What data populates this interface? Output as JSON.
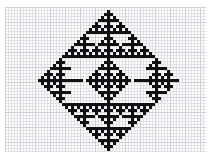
{
  "figure": {
    "kind": "pixel-grid-pattern"
  },
  "canvas": {
    "width": 211,
    "height": 165,
    "background_color": "#ffffff"
  },
  "graph_paper": {
    "left": 5,
    "top": 7,
    "width": 201,
    "height": 145,
    "cell_size": 3,
    "major_every": 5,
    "minor_line_color": "#e2e2e6",
    "major_line_color": "#cfcfd6",
    "paper_color": "#ffffff",
    "columns": 67,
    "rows": 48
  },
  "pattern": {
    "fill_color": "#111111",
    "cell_size": 3,
    "origin_col": 0,
    "origin_row": 0,
    "rule": "rule90-sierpinski-diamond",
    "center_col": 34,
    "top_row": 1,
    "bottom_row": 47,
    "half_height": 23,
    "description": "Rhombus outline with nested Sierpinski triangle texture, built row by row from a Rule 90 style cellular automaton and mirrored vertically about the mid row.",
    "rows": [
      {
        "row": 1,
        "runs": [
          [
            34,
            1
          ]
        ]
      },
      {
        "row": 2,
        "runs": [
          [
            33,
            3
          ]
        ]
      },
      {
        "row": 3,
        "runs": [
          [
            32,
            1
          ],
          [
            34,
            1
          ],
          [
            36,
            1
          ]
        ]
      },
      {
        "row": 4,
        "runs": [
          [
            31,
            7
          ]
        ]
      },
      {
        "row": 5,
        "runs": [
          [
            30,
            1
          ],
          [
            34,
            1
          ],
          [
            38,
            1
          ]
        ]
      },
      {
        "row": 6,
        "runs": [
          [
            29,
            3
          ],
          [
            33,
            3
          ],
          [
            37,
            3
          ]
        ]
      },
      {
        "row": 7,
        "runs": [
          [
            28,
            1
          ],
          [
            30,
            1
          ],
          [
            32,
            1
          ],
          [
            34,
            1
          ],
          [
            36,
            1
          ],
          [
            38,
            1
          ],
          [
            40,
            1
          ]
        ]
      },
      {
        "row": 8,
        "runs": [
          [
            27,
            15
          ]
        ]
      },
      {
        "row": 9,
        "runs": [
          [
            26,
            1
          ],
          [
            34,
            1
          ],
          [
            42,
            1
          ]
        ]
      },
      {
        "row": 10,
        "runs": [
          [
            25,
            3
          ],
          [
            33,
            3
          ],
          [
            41,
            3
          ]
        ]
      },
      {
        "row": 11,
        "runs": [
          [
            24,
            1
          ],
          [
            26,
            1
          ],
          [
            32,
            1
          ],
          [
            34,
            1
          ],
          [
            36,
            1
          ],
          [
            42,
            1
          ],
          [
            44,
            1
          ]
        ]
      },
      {
        "row": 12,
        "runs": [
          [
            23,
            7
          ],
          [
            31,
            7
          ],
          [
            39,
            7
          ]
        ]
      },
      {
        "row": 13,
        "runs": [
          [
            22,
            1
          ],
          [
            26,
            1
          ],
          [
            30,
            1
          ],
          [
            34,
            1
          ],
          [
            38,
            1
          ],
          [
            42,
            1
          ],
          [
            46,
            1
          ]
        ]
      },
      {
        "row": 14,
        "runs": [
          [
            21,
            3
          ],
          [
            25,
            3
          ],
          [
            29,
            3
          ],
          [
            33,
            3
          ],
          [
            37,
            3
          ],
          [
            41,
            3
          ],
          [
            45,
            3
          ]
        ]
      },
      {
        "row": 15,
        "runs": [
          [
            20,
            1
          ],
          [
            22,
            1
          ],
          [
            24,
            1
          ],
          [
            26,
            1
          ],
          [
            28,
            1
          ],
          [
            30,
            1
          ],
          [
            32,
            1
          ],
          [
            34,
            1
          ],
          [
            36,
            1
          ],
          [
            38,
            1
          ],
          [
            40,
            1
          ],
          [
            42,
            1
          ],
          [
            44,
            1
          ],
          [
            46,
            1
          ],
          [
            48,
            1
          ]
        ]
      },
      {
        "row": 16,
        "runs": [
          [
            19,
            31
          ]
        ]
      },
      {
        "row": 17,
        "runs": [
          [
            18,
            1
          ],
          [
            34,
            1
          ],
          [
            50,
            1
          ]
        ]
      },
      {
        "row": 18,
        "runs": [
          [
            17,
            3
          ],
          [
            33,
            3
          ],
          [
            49,
            3
          ]
        ]
      },
      {
        "row": 19,
        "runs": [
          [
            16,
            1
          ],
          [
            18,
            1
          ],
          [
            32,
            1
          ],
          [
            34,
            1
          ],
          [
            36,
            1
          ],
          [
            48,
            1
          ],
          [
            50,
            1
          ]
        ]
      },
      {
        "row": 20,
        "runs": [
          [
            15,
            7
          ],
          [
            31,
            7
          ],
          [
            47,
            7
          ]
        ]
      },
      {
        "row": 21,
        "runs": [
          [
            14,
            1
          ],
          [
            18,
            1
          ],
          [
            30,
            1
          ],
          [
            34,
            1
          ],
          [
            38,
            1
          ],
          [
            50,
            1
          ],
          [
            54,
            1
          ]
        ]
      },
      {
        "row": 22,
        "runs": [
          [
            13,
            3
          ],
          [
            17,
            3
          ],
          [
            29,
            3
          ],
          [
            33,
            3
          ],
          [
            37,
            3
          ],
          [
            49,
            3
          ],
          [
            53,
            3
          ]
        ]
      },
      {
        "row": 23,
        "runs": [
          [
            12,
            1
          ],
          [
            14,
            1
          ],
          [
            16,
            1
          ],
          [
            18,
            1
          ],
          [
            28,
            1
          ],
          [
            30,
            1
          ],
          [
            32,
            1
          ],
          [
            34,
            1
          ],
          [
            36,
            1
          ],
          [
            38,
            1
          ],
          [
            40,
            1
          ],
          [
            48,
            1
          ],
          [
            50,
            1
          ],
          [
            52,
            1
          ],
          [
            54,
            1
          ]
        ]
      },
      {
        "row": 24,
        "runs": [
          [
            11,
            15
          ],
          [
            27,
            15
          ],
          [
            43,
            15
          ]
        ]
      }
    ]
  }
}
